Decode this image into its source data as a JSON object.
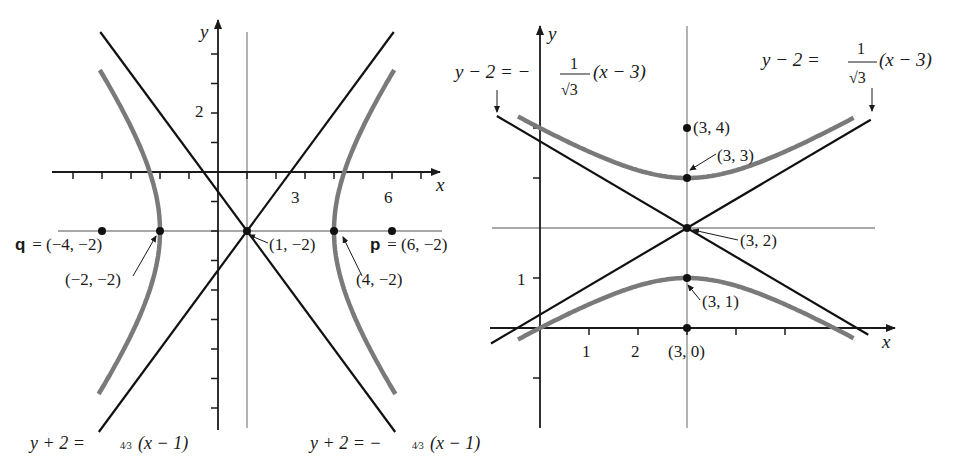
{
  "colors": {
    "axis": "#1a1a1a",
    "asymptote": "#111111",
    "hyperbola": "#7a7a7a",
    "guide": "#8a8a8a",
    "point": "#111111"
  },
  "figures": [
    {
      "id": "left",
      "description": "Horizontal hyperbola centered at (1,-2) with foci p and q",
      "x_axis_label": "x",
      "y_axis_label": "y",
      "x_range": [
        -5,
        7
      ],
      "y_range": [
        -8,
        4
      ],
      "x_tick_labels": [
        {
          "value": 3,
          "text": "3"
        },
        {
          "value": 6,
          "text": "6"
        }
      ],
      "y_tick_labels": [
        {
          "value": 2,
          "text": "2"
        }
      ],
      "center": [
        1,
        -2
      ],
      "a": 3,
      "b": 4,
      "orientation": "horizontal",
      "asymptotes": [
        {
          "slope": 1.3333,
          "point": [
            1,
            -2
          ],
          "text_main": "y + 2 = ",
          "text_frac": "4⁄3",
          "text_tail": "(x − 1)"
        },
        {
          "slope": -1.3333,
          "point": [
            1,
            -2
          ],
          "text_main": "y + 2 = −",
          "text_frac": "4⁄3",
          "text_tail": "(x − 1)"
        }
      ],
      "points": [
        {
          "x": -4,
          "y": -2,
          "label": "q = (−4, −2)",
          "prefix": "q",
          "rest": " = (−4, −2)"
        },
        {
          "x": -2,
          "y": -2,
          "label": "(−2, −2)"
        },
        {
          "x": 1,
          "y": -2,
          "label": "(1, −2)"
        },
        {
          "x": 4,
          "y": -2,
          "label": "(4, −2)"
        },
        {
          "x": 6,
          "y": -2,
          "label": "p = (6, −2)",
          "prefix": "p",
          "rest": " = (6, −2)"
        }
      ]
    },
    {
      "id": "right",
      "description": "Vertical hyperbola centered at (3,2) with foci (3,4) and (3,0)",
      "x_axis_label": "x",
      "y_axis_label": "y",
      "x_range": [
        -1,
        7
      ],
      "y_range": [
        -2,
        6
      ],
      "x_tick_labels": [
        {
          "value": 1,
          "text": "1"
        },
        {
          "value": 2,
          "text": "2"
        }
      ],
      "y_tick_labels": [
        {
          "value": 1,
          "text": "1"
        }
      ],
      "center": [
        3,
        2
      ],
      "a": 1,
      "b": 1.732,
      "orientation": "vertical",
      "asymptotes": [
        {
          "slope": -0.5774,
          "point": [
            3,
            2
          ],
          "text_main": "y − 2 = −",
          "text_num": "1",
          "text_den": "√3",
          "text_tail": "(x − 3)"
        },
        {
          "slope": 0.5774,
          "point": [
            3,
            2
          ],
          "text_main": "y − 2 = ",
          "text_num": "1",
          "text_den": "√3",
          "text_tail": "(x − 3)"
        }
      ],
      "points": [
        {
          "x": 3,
          "y": 4,
          "label": "(3, 4)"
        },
        {
          "x": 3,
          "y": 3,
          "label": "(3, 3)"
        },
        {
          "x": 3,
          "y": 2,
          "label": "(3, 2)"
        },
        {
          "x": 3,
          "y": 1,
          "label": "(3, 1)"
        },
        {
          "x": 3,
          "y": 0,
          "label": "(3, 0)"
        }
      ]
    }
  ]
}
